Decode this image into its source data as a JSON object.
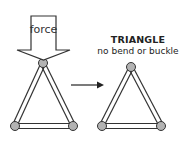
{
  "force_label": "force",
  "title": "TRIANGLE",
  "subtitle": "no bend or buckle",
  "colors": {
    "stroke": "#333333",
    "joint_fill": "#b3b3b3",
    "arrow_fill": "#ffffff",
    "background": "#ffffff"
  }
}
